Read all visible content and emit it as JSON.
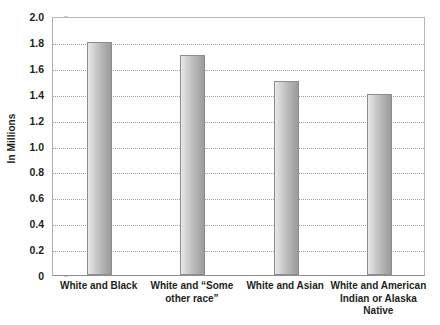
{
  "chart_data": {
    "type": "bar",
    "title": "",
    "xlabel": "",
    "ylabel": "In Millions",
    "ylim": [
      0,
      2.0
    ],
    "ytick_step": 0.2,
    "grid": true,
    "legend": "none",
    "categories": [
      "White and Black",
      "White and “Some other race”",
      "White and Asian",
      "White and American Indian or Alaska Native"
    ],
    "category_lines": [
      [
        "White and Black"
      ],
      [
        "White and “Some",
        "other race”"
      ],
      [
        "White and Asian"
      ],
      [
        "White and American",
        "Indian or Alaska",
        "Native"
      ]
    ],
    "values": [
      1.8,
      1.7,
      1.5,
      1.4
    ],
    "ytick_labels": [
      "2.0",
      "1.8",
      "1.6",
      "1.4",
      "1.2",
      "1.0",
      "0.8",
      "0.6",
      "0.4",
      "0.2",
      "0"
    ],
    "ytick_values": [
      2.0,
      1.8,
      1.6,
      1.4,
      1.2,
      1.0,
      0.8,
      0.6,
      0.4,
      0.2,
      0
    ],
    "colors": {
      "bar_light": "#e9e9e9",
      "bar_dark": "#9b9b9b",
      "bar_border": "#8d8d8d",
      "gridline": "#8c8c8c",
      "axis": "#b8b8b8",
      "text": "#231f20",
      "background": "#ffffff"
    }
  }
}
